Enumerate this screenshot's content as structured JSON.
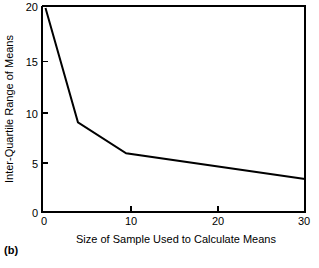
{
  "figure": {
    "caption": "(b)"
  },
  "chart_data": {
    "type": "line",
    "title": "",
    "subtitle": "",
    "xlabel": "Size of Sample Used to Calculate Means",
    "ylabel": "Inter-Quartile Range of Means",
    "xlim": [
      0,
      30
    ],
    "ylim": [
      0,
      20
    ],
    "xticks": [
      0,
      10,
      20,
      30
    ],
    "yticks": [
      0,
      5,
      10,
      15,
      20
    ],
    "xtick_labels": [
      "0",
      "10",
      "20",
      "30"
    ],
    "ytick_labels": [
      "0",
      "5",
      "10",
      "15",
      "20"
    ],
    "grid": false,
    "legend": null,
    "annotations": [],
    "series": [
      {
        "name": "Inter-Quartile Range of Means",
        "color": "#000000",
        "x": [
          0.4,
          4.1,
          9.6,
          30.0
        ],
        "y": [
          19.8,
          8.7,
          5.7,
          3.2
        ],
        "points": [
          {
            "x": 0.4,
            "y": 19.8
          },
          {
            "x": 4.1,
            "y": 8.7
          },
          {
            "x": 9.6,
            "y": 5.7
          },
          {
            "x": 30.0,
            "y": 3.2
          }
        ]
      }
    ]
  }
}
